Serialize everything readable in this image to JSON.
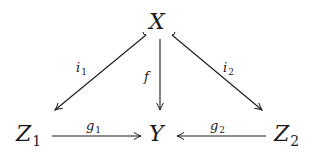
{
  "diagram": {
    "type": "commutative-diagram",
    "nodes": {
      "X": {
        "base": "X",
        "sub": ""
      },
      "Y": {
        "base": "Y",
        "sub": ""
      },
      "Z1": {
        "base": "Z",
        "sub": "1"
      },
      "Z2": {
        "base": "Z",
        "sub": "2"
      }
    },
    "arrows": {
      "i1": {
        "base": "i",
        "sub": "1",
        "from": "X",
        "to": "Z1",
        "style": "hook"
      },
      "i2": {
        "base": "i",
        "sub": "2",
        "from": "X",
        "to": "Z2",
        "style": "hook"
      },
      "f": {
        "base": "f",
        "sub": "",
        "from": "X",
        "to": "Y",
        "style": "plain"
      },
      "g1": {
        "base": "g",
        "sub": "1",
        "from": "Z1",
        "to": "Y",
        "style": "plain"
      },
      "g2": {
        "base": "g",
        "sub": "2",
        "from": "Z2",
        "to": "Y",
        "style": "plain"
      }
    },
    "colors": {
      "ink": "#1a1a1a",
      "background": "#ffffff"
    }
  }
}
